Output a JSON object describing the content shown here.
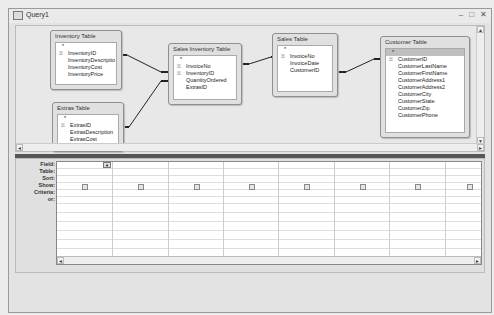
{
  "window": {
    "title": "Query1",
    "controls": {
      "minimize": "–",
      "restore": "□",
      "close": "✕"
    }
  },
  "tables": [
    {
      "name": "Inventory Table",
      "fields": [
        "*",
        "InventoryID",
        "InventoryDescriptio",
        "InventoryCost",
        "InventoryPrice"
      ],
      "keys": [
        1
      ]
    },
    {
      "name": "Extras Table",
      "fields": [
        "*",
        "ExtrasID",
        "ExtrasDescription",
        "ExtrasCost",
        "ExtrasPrice"
      ],
      "keys": [
        1
      ]
    },
    {
      "name": "Sales Inventory Table",
      "fields": [
        "*",
        "InvoiceNo",
        "InventoryID",
        "QuantityOrdered",
        "ExtrasID"
      ],
      "keys": [
        1,
        2
      ]
    },
    {
      "name": "Sales Table",
      "fields": [
        "*",
        "InvoiceNo",
        "InvoiceDate",
        "CustomerID"
      ],
      "keys": [
        1
      ]
    },
    {
      "name": "Customer Table",
      "fields": [
        "*",
        "CustomerID",
        "CustomerLastName",
        "CustomerFirstName",
        "CustomerAddress1",
        "CustomerAddress2",
        "CustomerCity",
        "CustomerState",
        "CustomerZip",
        "CustomerPhone"
      ],
      "keys": [
        1
      ]
    }
  ],
  "relationships": [
    {
      "from": "Inventory Table.InventoryID",
      "to": "Sales Inventory Table.InventoryID",
      "one": "1",
      "many": "∞"
    },
    {
      "from": "Extras Table.ExtrasID",
      "to": "Sales Inventory Table.ExtrasID",
      "one": "1",
      "many": "∞"
    },
    {
      "from": "Sales Table.InvoiceNo",
      "to": "Sales Inventory Table.InvoiceNo",
      "one": "1",
      "many": "∞"
    },
    {
      "from": "Customer Table.CustomerID",
      "to": "Sales Table.CustomerID",
      "one": "1",
      "many": "∞"
    }
  ],
  "grid": {
    "row_labels": [
      "Field:",
      "Table:",
      "Sort:",
      "Show:",
      "Criteria:",
      "or:"
    ],
    "column_count": 8
  },
  "icons": {
    "key": "⚿",
    "scroll_up": "▲",
    "scroll_down": "▼",
    "scroll_left": "◄",
    "scroll_right": "►",
    "dropdown": "▼"
  }
}
